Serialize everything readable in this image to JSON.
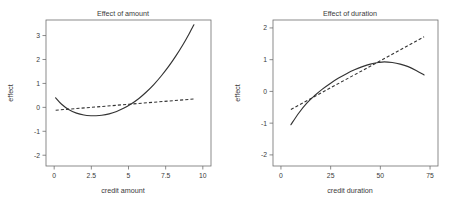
{
  "figure": {
    "panel_count": 2,
    "background": "#ffffff",
    "line_color": "#333333",
    "axis_color": "#6e6e6e"
  },
  "chart_data": [
    {
      "type": "line",
      "title": "Effect of amount",
      "xlabel": "credit amount",
      "ylabel": "effect",
      "xlim": [
        -0.55,
        10.55
      ],
      "ylim": [
        -2.45,
        3.65
      ],
      "xticks": [
        0,
        2.5,
        5,
        7.5,
        10
      ],
      "xticklabels": [
        "0",
        "2.5",
        "5",
        "7.5",
        "10"
      ],
      "yticks": [
        -2,
        -1,
        0,
        1,
        2,
        3
      ],
      "yticklabels": [
        "-2",
        "-1",
        "0",
        "1",
        "2",
        "3"
      ],
      "grid": false,
      "legend": "none",
      "series": [
        {
          "name": "smooth-effect",
          "style": "solid",
          "x": [
            0.1,
            0.5,
            1.0,
            1.5,
            2.0,
            2.5,
            2.8,
            3.2,
            3.7,
            4.2,
            4.7,
            5.2,
            5.7,
            6.2,
            6.7,
            7.2,
            7.7,
            8.2,
            8.7,
            9.1,
            9.4
          ],
          "y": [
            0.4,
            0.13,
            -0.1,
            -0.24,
            -0.32,
            -0.35,
            -0.35,
            -0.33,
            -0.27,
            -0.17,
            -0.03,
            0.15,
            0.37,
            0.64,
            0.95,
            1.31,
            1.71,
            2.16,
            2.66,
            3.1,
            3.45
          ]
        },
        {
          "name": "linear-effect",
          "style": "dashed",
          "x": [
            0.1,
            9.4
          ],
          "y": [
            -0.12,
            0.35
          ]
        }
      ]
    },
    {
      "type": "line",
      "title": "Effect of duration",
      "xlabel": "credit duration",
      "ylabel": "effect",
      "xlim": [
        -4.0,
        79.0
      ],
      "ylim": [
        -2.35,
        2.25
      ],
      "xticks": [
        0,
        25,
        50,
        75
      ],
      "xticklabels": [
        "0",
        "25",
        "50",
        "75"
      ],
      "yticks": [
        -2,
        -1,
        0,
        1,
        2
      ],
      "yticklabels": [
        "-2",
        "-1",
        "0",
        "1",
        "2"
      ],
      "grid": false,
      "legend": "none",
      "series": [
        {
          "name": "smooth-effect",
          "style": "solid",
          "x": [
            5,
            9,
            13,
            17,
            21,
            25,
            29,
            33,
            37,
            41,
            45,
            49,
            52,
            56,
            60,
            64,
            68,
            72
          ],
          "y": [
            -1.05,
            -0.68,
            -0.37,
            -0.13,
            0.08,
            0.26,
            0.42,
            0.56,
            0.68,
            0.78,
            0.86,
            0.91,
            0.93,
            0.91,
            0.86,
            0.78,
            0.66,
            0.52
          ]
        },
        {
          "name": "linear-effect",
          "style": "dashed",
          "x": [
            5,
            72
          ],
          "y": [
            -0.57,
            1.72
          ]
        }
      ]
    }
  ]
}
